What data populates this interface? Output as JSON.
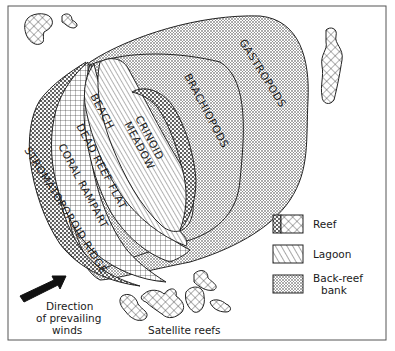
{
  "diagram": {
    "type": "reef-complex-map",
    "zones": {
      "gastropods": "GASTROPODS",
      "brachiopods": "BRACHIOPODS",
      "crinoid_meadow_1": "CRINOID",
      "crinoid_meadow_2": "MEADOW",
      "beach": "BEACH",
      "dead_reef_flat": "DEAD REEF FLAT",
      "coral_rampart": "CORAL RAMPART",
      "stromatoporoid_ridge": "STROMATOPOROID RIDGE"
    },
    "legend": {
      "items": [
        {
          "key": "reef",
          "label": "Reef",
          "pattern": "crosshatch-with-stipple"
        },
        {
          "key": "lagoon",
          "label": "Lagoon",
          "pattern": "diagonal-lines"
        },
        {
          "key": "back_reef_bank",
          "label_1": "Back-reef",
          "label_2": "bank",
          "pattern": "fine-dots"
        }
      ]
    },
    "wind": {
      "line_1": "Direction",
      "line_2": "of prevailing",
      "line_3": "winds",
      "icon": "arrow-northeast-icon"
    },
    "satellite_reefs_label": "Satellite reefs",
    "colors": {
      "ink": "#1a1a1a",
      "paper": "#ffffff",
      "frame": "#555555"
    }
  }
}
